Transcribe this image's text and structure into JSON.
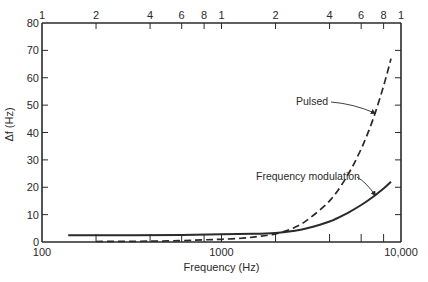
{
  "chart_data": {
    "type": "line",
    "title": "",
    "xlabel": "Frequency (Hz)",
    "ylabel": "Δf (Hz)",
    "xscale": "log",
    "xlim": [
      100,
      10000
    ],
    "ylim": [
      0,
      80
    ],
    "grid": false,
    "legend": "none (inline annotations)",
    "x_ticks_bottom": [
      {
        "value": 100,
        "label": "100"
      },
      {
        "value": 200,
        "label": ""
      },
      {
        "value": 400,
        "label": ""
      },
      {
        "value": 600,
        "label": ""
      },
      {
        "value": 800,
        "label": ""
      },
      {
        "value": 1000,
        "label": "1000"
      },
      {
        "value": 2000,
        "label": ""
      },
      {
        "value": 4000,
        "label": ""
      },
      {
        "value": 6000,
        "label": ""
      },
      {
        "value": 8000,
        "label": ""
      },
      {
        "value": 10000,
        "label": "10,000"
      }
    ],
    "x_ticks_top": [
      {
        "value": 100,
        "label": "1"
      },
      {
        "value": 200,
        "label": "2"
      },
      {
        "value": 400,
        "label": "4"
      },
      {
        "value": 600,
        "label": "6"
      },
      {
        "value": 800,
        "label": "8"
      },
      {
        "value": 1000,
        "label": "1"
      },
      {
        "value": 2000,
        "label": "2"
      },
      {
        "value": 4000,
        "label": "4"
      },
      {
        "value": 6000,
        "label": "6"
      },
      {
        "value": 8000,
        "label": "8"
      },
      {
        "value": 10000,
        "label": "1"
      }
    ],
    "y_ticks": [
      {
        "value": 0,
        "label": "0"
      },
      {
        "value": 10,
        "label": "10"
      },
      {
        "value": 20,
        "label": "20"
      },
      {
        "value": 30,
        "label": "30"
      },
      {
        "value": 40,
        "label": "40"
      },
      {
        "value": 50,
        "label": "50"
      },
      {
        "value": 60,
        "label": "60"
      },
      {
        "value": 70,
        "label": "70"
      },
      {
        "value": 80,
        "label": "80"
      }
    ],
    "series": [
      {
        "name": "Frequency modulation",
        "style": "solid",
        "x": [
          140,
          300,
          600,
          1000,
          1500,
          2000,
          2500,
          3000,
          4000,
          5000,
          6000,
          7000,
          8000,
          8800
        ],
        "y": [
          2.5,
          2.5,
          2.6,
          2.8,
          3.0,
          3.3,
          4.0,
          5.0,
          7.5,
          10.5,
          13.5,
          16.5,
          19.5,
          22.0
        ]
      },
      {
        "name": "Pulsed",
        "style": "dashed",
        "x": [
          200,
          400,
          600,
          800,
          1000,
          1300,
          1600,
          2000,
          2500,
          3000,
          4000,
          5000,
          6000,
          7000,
          8000,
          8800
        ],
        "y": [
          0.2,
          0.3,
          0.5,
          0.8,
          1.0,
          1.4,
          2.0,
          3.0,
          5.0,
          8.0,
          15.0,
          24.0,
          34.0,
          45.0,
          57.0,
          67.0
        ]
      }
    ],
    "annotations": [
      {
        "text": "Pulsed",
        "target_series": "Pulsed",
        "arrow_to": {
          "x": 7200,
          "y": 47
        }
      },
      {
        "text": "Frequency modulation",
        "target_series": "Frequency modulation",
        "arrow_to": {
          "x": 7200,
          "y": 17
        }
      }
    ],
    "colors": {
      "ink": "#2a2a2a",
      "background": "#ffffff"
    }
  }
}
